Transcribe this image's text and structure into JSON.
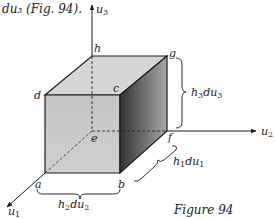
{
  "caption_fragment": "du₃ (Fig. 94).",
  "figure_label": "Figure 94",
  "axes": {
    "u1": {
      "base": "u",
      "sub": "1"
    },
    "u2": {
      "base": "u",
      "sub": "2"
    },
    "u3": {
      "base": "u",
      "sub": "3"
    }
  },
  "vertices": {
    "a": "a",
    "b": "b",
    "c": "c",
    "d": "d",
    "e": "e",
    "f": "f",
    "g": "g",
    "h": "h"
  },
  "dimensions": {
    "h1du1": {
      "p1": "h",
      "s1": "1",
      "p2": "du",
      "s2": "1"
    },
    "h2du2": {
      "p1": "h",
      "s1": "2",
      "p2": "du",
      "s2": "2"
    },
    "h3du3": {
      "p1": "h",
      "s1": "3",
      "p2": "du",
      "s2": "3"
    }
  },
  "colors": {
    "front_face": "#c8c8c8",
    "top_face": "#d4d4d4",
    "side_face_light": "#9a9a9a",
    "side_face_dark": "#3a3a3a",
    "line": "#1a1a1a"
  }
}
